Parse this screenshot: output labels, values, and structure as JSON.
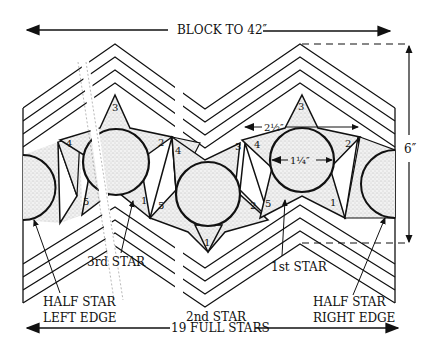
{
  "title": {
    "top_dimension": "BLOCK TO 42″",
    "bottom_dimension": "19 FULL STARS",
    "height_dimension": "6″"
  },
  "measurements": {
    "star_width": "2½″",
    "circle_diameter": "1¼″"
  },
  "callouts": {
    "half_star_left": [
      "HALF STAR",
      "LEFT EDGE"
    ],
    "half_star_right": [
      "HALF STAR",
      "RIGHT EDGE"
    ],
    "first_star": "1st STAR",
    "second_star": "2nd STAR",
    "third_star": "3rd STAR"
  },
  "piece_numbers": {
    "star3_left": [
      "3",
      "4",
      "2",
      "1",
      "5"
    ],
    "star2_center": [
      "1",
      "4",
      "5",
      "3",
      "2"
    ],
    "star1_right": [
      "3",
      "4",
      "2",
      "5",
      "1"
    ]
  },
  "colors": {
    "line": "#111111",
    "background": "#ffffff",
    "stipple": "#d9d9d9"
  }
}
